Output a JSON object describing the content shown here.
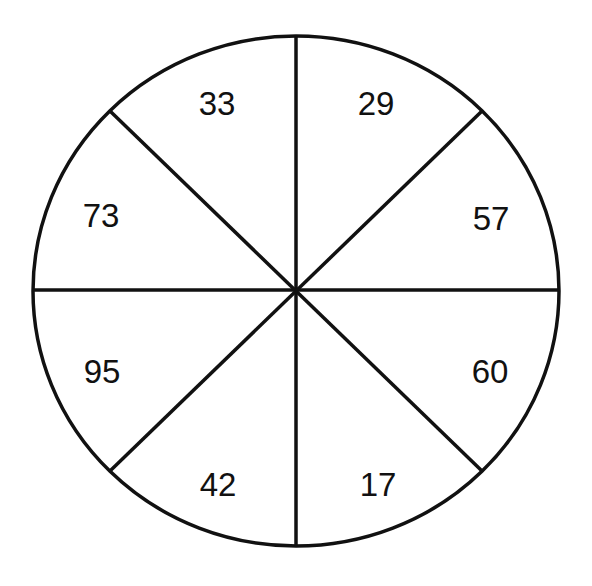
{
  "diagram": {
    "type": "circle-divided-into-8-sectors",
    "stroke_color": "#111111",
    "background": "#ffffff",
    "sectors": [
      {
        "position": "top-left",
        "value": "33"
      },
      {
        "position": "top-right",
        "value": "29"
      },
      {
        "position": "right-upper",
        "value": "57"
      },
      {
        "position": "right-lower",
        "value": "60"
      },
      {
        "position": "bottom-right",
        "value": "17"
      },
      {
        "position": "bottom-left",
        "value": "42"
      },
      {
        "position": "left-lower",
        "value": "95"
      },
      {
        "position": "left-upper",
        "value": "73"
      }
    ]
  }
}
